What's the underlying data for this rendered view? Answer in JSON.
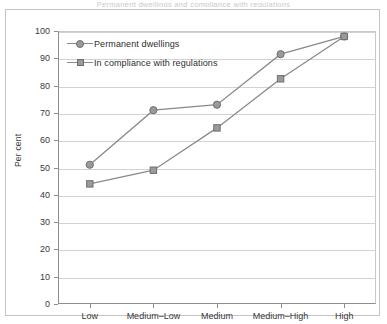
{
  "figure": {
    "title": "Permanent dwellings and compliance with regulations",
    "axis_color": "#8d8d8d",
    "grid_color": "#d2d2d2",
    "series_color": "#8a8a8a",
    "marker_fill": "#9a9a9a",
    "marker_stroke": "#6e6e6e"
  },
  "legend": {
    "position": "top-left-inside",
    "entries": [
      {
        "label": "Permanent dwellings",
        "marker": "circle-marker-icon"
      },
      {
        "label": "In compliance with regulations",
        "marker": "square-marker-icon"
      }
    ]
  },
  "chart_data": {
    "type": "line",
    "title": "Permanent dwellings and compliance with regulations",
    "xlabel": "",
    "ylabel": "Per cent",
    "categories": [
      "Low",
      "Medium–Low",
      "Medium",
      "Medium–High",
      "High"
    ],
    "ylim": [
      0,
      100
    ],
    "yticks": [
      0,
      10,
      20,
      30,
      40,
      50,
      60,
      70,
      80,
      90,
      100
    ],
    "ytick_labels": [
      "0",
      "10",
      "20",
      "30",
      "40",
      "50",
      "60",
      "70",
      "80",
      "90",
      "100"
    ],
    "grid": "horizontal",
    "legend_position": "upper left",
    "series": [
      {
        "name": "Permanent dwellings",
        "marker": "circle",
        "values": [
          51,
          71,
          73,
          91.5,
          98
        ]
      },
      {
        "name": "In compliance with regulations",
        "marker": "square",
        "values": [
          44,
          49,
          64.5,
          82.5,
          98
        ]
      }
    ]
  }
}
